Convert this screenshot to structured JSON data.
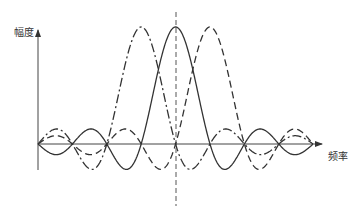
{
  "axes": {
    "y_label": "幅度",
    "x_label": "频率"
  },
  "layout": {
    "origin_x": 38,
    "axis_y": 144,
    "spacing": 34.4,
    "peak_height": 117,
    "x_start": 38,
    "x_end": 313,
    "x_axis_end": 322,
    "y_axis_top": 30,
    "y_axis_bottom": 170,
    "center_line_x": 176,
    "center_line_top": 12,
    "center_line_bottom": 206,
    "stroke_color": "#333333"
  },
  "curves": [
    {
      "name": "dash-dot-sinc",
      "center_index": 3,
      "style": "dashdot"
    },
    {
      "name": "solid-sinc",
      "center_index": 4,
      "style": "solid"
    },
    {
      "name": "dashed-sinc",
      "center_index": 5,
      "style": "dashed"
    }
  ]
}
